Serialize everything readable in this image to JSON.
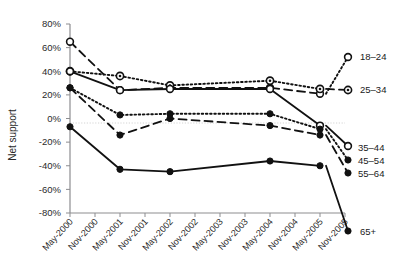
{
  "chart_data": {
    "type": "line",
    "title": "",
    "xlabel": "",
    "ylabel": "Net support",
    "ylim": [
      -80,
      80
    ],
    "ytick_labels": [
      "80%",
      "60%",
      "40%",
      "20%",
      "0%",
      "-20%",
      "-40%",
      "-60%",
      "-80%"
    ],
    "ytick_values": [
      80,
      60,
      40,
      20,
      0,
      -20,
      -40,
      -60,
      -80
    ],
    "grid": "zero-line-only",
    "legend_position": "right",
    "categories": [
      "May-2000",
      "Nov-2000",
      "May-2001",
      "Nov-2001",
      "May-2002",
      "Nov-2002",
      "May-2003",
      "Nov-2003",
      "May-2004",
      "Nov-2004",
      "May-2005",
      "Nov-2005"
    ],
    "xtick_labels": [
      "May-2000",
      "Nov-2000",
      "May-2001",
      "Nov-2001",
      "May-2002",
      "Nov-2002",
      "May-2003",
      "Nov-2003",
      "May-2004",
      "Nov-2004",
      "May-2005",
      "Nov-2005"
    ],
    "series": [
      {
        "name": "18–24",
        "marker": "open-circle",
        "dash": "dashed",
        "x": [
          "May-2000",
          "May-2001",
          "May-2002",
          "May-2004",
          "May-2005"
        ],
        "values": [
          65,
          24,
          26,
          26,
          21
        ]
      },
      {
        "name": "25–34",
        "marker": "ring",
        "dash": "dotted",
        "x": [
          "May-2000",
          "May-2001",
          "May-2002",
          "May-2004",
          "May-2005"
        ],
        "values": [
          40,
          36,
          28,
          32,
          25
        ]
      },
      {
        "name": "35–44",
        "marker": "open-circle",
        "dash": "solid",
        "x": [
          "May-2000",
          "May-2001",
          "May-2002",
          "May-2004",
          "May-2005"
        ],
        "values": [
          40,
          24,
          25,
          25,
          -6
        ]
      },
      {
        "name": "45–54",
        "marker": "dot",
        "dash": "dotted",
        "x": [
          "May-2000",
          "May-2001",
          "May-2002",
          "May-2004",
          "May-2005"
        ],
        "values": [
          26,
          3,
          4,
          4,
          -9
        ]
      },
      {
        "name": "55–64",
        "marker": "dot",
        "dash": "dashed",
        "x": [
          "May-2000",
          "May-2001",
          "May-2002",
          "May-2004",
          "May-2005"
        ],
        "values": [
          26,
          -14,
          0,
          -6,
          -14
        ]
      },
      {
        "name": "65+",
        "marker": "dot",
        "dash": "solid",
        "x": [
          "May-2000",
          "May-2001",
          "May-2002",
          "May-2004",
          "May-2005"
        ],
        "values": [
          -7,
          -43,
          -45,
          -36,
          -40
        ]
      }
    ],
    "legend": [
      {
        "label": "18–24"
      },
      {
        "label": "25–34"
      },
      {
        "label": "35–44"
      },
      {
        "label": "45–54"
      },
      {
        "label": "55–64"
      },
      {
        "label": "65+"
      }
    ]
  },
  "colors": {
    "ink": "#111111",
    "axis": "#8d8d90",
    "grid": "#cfcfcf",
    "background": "#ffffff"
  }
}
